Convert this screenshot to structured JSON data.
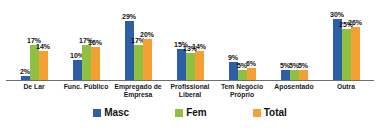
{
  "chart_data": {
    "type": "bar",
    "title": "",
    "xlabel": "",
    "ylabel": "",
    "categories": [
      "De Lar",
      "Func. Público",
      "Empregado de Empresa",
      "Profissional Liberal",
      "Tem Negócio Próprio",
      "Aposentado",
      "Outra"
    ],
    "series": [
      {
        "name": "Masc",
        "color": "#2e5fa6",
        "values": [
          2,
          10,
          29,
          15,
          9,
          5,
          30
        ]
      },
      {
        "name": "Fem",
        "color": "#8fc041",
        "values": [
          17,
          17,
          17,
          13,
          5,
          5,
          25
        ]
      },
      {
        "name": "Total",
        "color": "#f5a033",
        "values": [
          14,
          16,
          20,
          14,
          6,
          5,
          26
        ]
      }
    ],
    "data_labels": true,
    "label_suffix": "%",
    "ylim": [
      0,
      32
    ],
    "grid": false,
    "legend_position": "bottom",
    "axis_line_color": "#6e6e6e"
  }
}
